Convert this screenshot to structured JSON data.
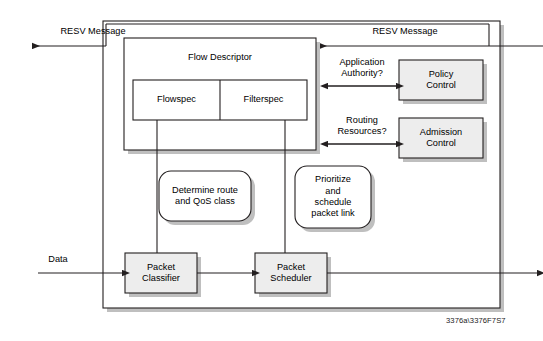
{
  "diagram": {
    "title_caption": "3376a\\3376F7S7",
    "outer_container": {
      "name": "router-node"
    },
    "labels": {
      "resv_left": "RESV Message",
      "resv_right": "RESV Message",
      "data_in": "Data",
      "application_authority": "Application\nAuthority?",
      "routing_resources": "Routing\nResources?"
    },
    "boxes": [
      {
        "id": "flow-descriptor",
        "label": "Flow Descriptor"
      },
      {
        "id": "flowspec",
        "label": "Flowspec"
      },
      {
        "id": "filterspec",
        "label": "Filterspec"
      },
      {
        "id": "policy-control",
        "label": "Policy\nControl"
      },
      {
        "id": "admission-control",
        "label": "Admission\nControl"
      },
      {
        "id": "packet-classifier",
        "label": "Packet\nClassifier"
      },
      {
        "id": "packet-scheduler",
        "label": "Packet\nScheduler"
      }
    ],
    "callouts": [
      {
        "id": "determine-route",
        "label": "Determine route\nand QoS class"
      },
      {
        "id": "prioritize-schedule",
        "label": "Prioritize\nand\nschedule\npacket link"
      }
    ],
    "colors": {
      "stroke": "#231f20",
      "box_fill": "#ededed",
      "white_fill": "#ffffff",
      "shadow": "#bfbfbf",
      "background": "#ffffff"
    }
  }
}
